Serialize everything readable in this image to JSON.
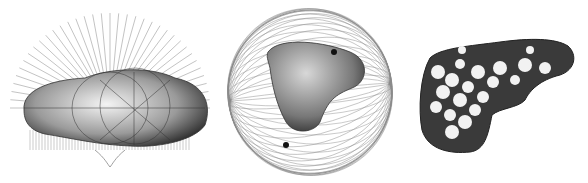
{
  "figure": {
    "panels": [
      {
        "id": "a",
        "description": "elongated blob mesh with radial projection lines (normals) fanning above and below"
      },
      {
        "id": "b",
        "description": "heart-like tetrahedral shape inside a spherical wireframe cage with two pole singularities"
      },
      {
        "id": "c",
        "description": "dark meshed L-shaped solid with white circular holes/cells"
      }
    ],
    "colors": {
      "background": "#ffffff",
      "line": "#555555",
      "light_line": "#9a9a9a",
      "shape_dark": "#2a2a2a",
      "shape_mid": "#7a7a7a",
      "hole": "#f2f2f2"
    }
  }
}
